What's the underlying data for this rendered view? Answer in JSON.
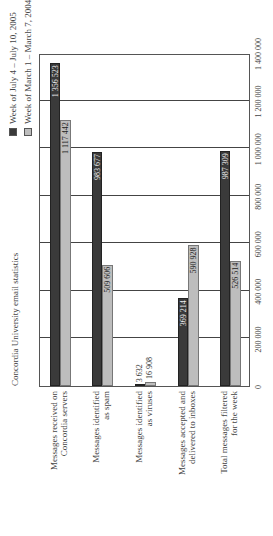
{
  "chart_data": {
    "type": "bar",
    "orientation": "horizontal",
    "title": "Concordia University email statistics",
    "categories": [
      "Messages received on\nConcordia servers",
      "Messages identified\nas spam",
      "Messages identified\nas viruses",
      "Messages accepted and\ndelivered to inboxes",
      "Total messages filtered\nfor the week"
    ],
    "series": [
      {
        "name": "Week of July 4 – July 10, 2005",
        "color": "#3a3a3a",
        "values": [
          1356523,
          983677,
          3632,
          369214,
          987309
        ],
        "labels": [
          "1 356 523",
          "983 677",
          "3 632",
          "369 214",
          "987 309"
        ]
      },
      {
        "name": "Week of March 1 – March 7, 2004",
        "color": "#bdbdbd",
        "values": [
          1117442,
          509606,
          16908,
          590928,
          526514
        ],
        "labels": [
          "1 117 442",
          "509 606",
          "16 908",
          "590 928",
          "526 514"
        ]
      }
    ],
    "xlim": [
      0,
      1400000
    ],
    "ticks": [
      "0",
      "200 000",
      "400 000",
      "600 000",
      "800 000",
      "1 000 000",
      "1 200 000",
      "1 400 000"
    ],
    "grid": true,
    "legend_position": "top-right"
  }
}
